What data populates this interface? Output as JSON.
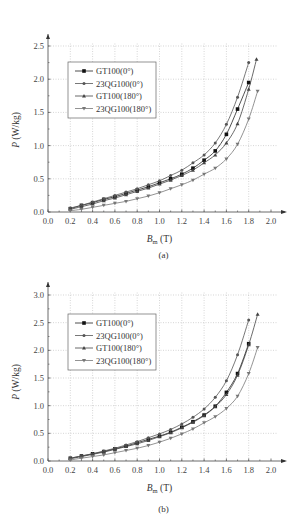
{
  "chart_data": [
    {
      "type": "line",
      "id": "a",
      "caption": "(a)",
      "title": "",
      "xlabel": "B_m (T)",
      "xlabel_main": "B",
      "xlabel_sub": "m",
      "xlabel_unit": " (T)",
      "ylabel": "P (W/kg)",
      "ylabel_var": "P",
      "ylabel_unit": " (W/kg)",
      "xlim": [
        0.0,
        2.0
      ],
      "ylim": [
        0.0,
        2.5
      ],
      "xticks": [
        "0.0",
        "0.2",
        "0.4",
        "0.6",
        "0.8",
        "1.0",
        "1.2",
        "1.4",
        "1.6",
        "1.8",
        "2.0"
      ],
      "yticks": [
        "0.0",
        "0.5",
        "1.0",
        "1.5",
        "2.0",
        "2.5"
      ],
      "grid": true,
      "legend_position": "upper-left",
      "series": [
        {
          "name": "GT100(0°)",
          "marker": "square-filled",
          "x": [
            0.2,
            0.3,
            0.4,
            0.5,
            0.6,
            0.7,
            0.8,
            0.9,
            1.0,
            1.1,
            1.2,
            1.3,
            1.4,
            1.5,
            1.6,
            1.7,
            1.8
          ],
          "y": [
            0.05,
            0.1,
            0.14,
            0.19,
            0.23,
            0.28,
            0.33,
            0.38,
            0.44,
            0.5,
            0.57,
            0.66,
            0.78,
            0.92,
            1.17,
            1.55,
            1.95
          ]
        },
        {
          "name": "23QG100(0°)",
          "marker": "cross",
          "x": [
            0.2,
            0.3,
            0.4,
            0.5,
            0.6,
            0.7,
            0.8,
            0.9,
            1.0,
            1.1,
            1.2,
            1.3,
            1.4,
            1.5,
            1.6,
            1.7,
            1.8
          ],
          "y": [
            0.06,
            0.1,
            0.15,
            0.2,
            0.25,
            0.3,
            0.35,
            0.41,
            0.47,
            0.55,
            0.63,
            0.74,
            0.86,
            1.04,
            1.32,
            1.73,
            2.25
          ]
        },
        {
          "name": "GT100(180°)",
          "marker": "triangle",
          "x": [
            0.2,
            0.3,
            0.4,
            0.5,
            0.6,
            0.7,
            0.8,
            0.9,
            1.0,
            1.1,
            1.2,
            1.3,
            1.4,
            1.5,
            1.6,
            1.7,
            1.8,
            1.87
          ],
          "y": [
            0.04,
            0.08,
            0.12,
            0.17,
            0.21,
            0.26,
            0.31,
            0.36,
            0.42,
            0.48,
            0.55,
            0.63,
            0.74,
            0.86,
            1.04,
            1.33,
            1.85,
            2.3
          ]
        },
        {
          "name": "23QG100(180°)",
          "marker": "down-triangle",
          "x": [
            0.2,
            0.3,
            0.4,
            0.5,
            0.6,
            0.7,
            0.8,
            0.9,
            1.0,
            1.1,
            1.2,
            1.3,
            1.4,
            1.5,
            1.6,
            1.7,
            1.8,
            1.88
          ],
          "y": [
            0.02,
            0.04,
            0.07,
            0.1,
            0.13,
            0.16,
            0.2,
            0.24,
            0.29,
            0.35,
            0.41,
            0.48,
            0.57,
            0.66,
            0.8,
            1.02,
            1.4,
            1.82
          ]
        }
      ]
    },
    {
      "type": "line",
      "id": "b",
      "caption": "(b)",
      "title": "",
      "xlabel": "B_m (T)",
      "xlabel_main": "B",
      "xlabel_sub": "m",
      "xlabel_unit": " (T)",
      "ylabel": "P (W/kg)",
      "ylabel_var": "P",
      "ylabel_unit": " (W/kg)",
      "xlim": [
        0.0,
        2.0
      ],
      "ylim": [
        0.0,
        3.0
      ],
      "xticks": [
        "0.0",
        "0.2",
        "0.4",
        "0.6",
        "0.8",
        "1.0",
        "1.2",
        "1.4",
        "1.6",
        "1.8",
        "2.0"
      ],
      "yticks": [
        "0.0",
        "0.5",
        "1.0",
        "1.5",
        "2.0",
        "2.5",
        "3.0"
      ],
      "grid": true,
      "legend_position": "upper-left",
      "series": [
        {
          "name": "GT100(0°)",
          "marker": "square-filled",
          "x": [
            0.2,
            0.3,
            0.4,
            0.5,
            0.6,
            0.7,
            0.8,
            0.9,
            1.0,
            1.1,
            1.2,
            1.3,
            1.4,
            1.5,
            1.6,
            1.7,
            1.8
          ],
          "y": [
            0.05,
            0.09,
            0.13,
            0.17,
            0.22,
            0.27,
            0.33,
            0.39,
            0.45,
            0.52,
            0.61,
            0.71,
            0.83,
            0.99,
            1.24,
            1.58,
            2.12
          ]
        },
        {
          "name": "23QG100(0°)",
          "marker": "cross",
          "x": [
            0.2,
            0.3,
            0.4,
            0.5,
            0.6,
            0.7,
            0.8,
            0.9,
            1.0,
            1.1,
            1.2,
            1.3,
            1.4,
            1.5,
            1.6,
            1.7,
            1.8
          ],
          "y": [
            0.05,
            0.09,
            0.13,
            0.18,
            0.23,
            0.29,
            0.35,
            0.42,
            0.49,
            0.57,
            0.67,
            0.79,
            0.94,
            1.15,
            1.45,
            1.92,
            2.55
          ]
        },
        {
          "name": "GT100(180°)",
          "marker": "triangle",
          "x": [
            0.2,
            0.3,
            0.4,
            0.5,
            0.6,
            0.7,
            0.8,
            0.9,
            1.0,
            1.1,
            1.2,
            1.3,
            1.4,
            1.5,
            1.6,
            1.7,
            1.8,
            1.88
          ],
          "y": [
            0.04,
            0.08,
            0.12,
            0.16,
            0.21,
            0.26,
            0.31,
            0.37,
            0.44,
            0.51,
            0.6,
            0.7,
            0.82,
            0.98,
            1.2,
            1.55,
            2.1,
            2.65
          ]
        },
        {
          "name": "23QG100(180°)",
          "marker": "down-triangle",
          "x": [
            0.2,
            0.3,
            0.4,
            0.5,
            0.6,
            0.7,
            0.8,
            0.9,
            1.0,
            1.1,
            1.2,
            1.3,
            1.4,
            1.5,
            1.6,
            1.7,
            1.8,
            1.88
          ],
          "y": [
            0.02,
            0.05,
            0.08,
            0.11,
            0.15,
            0.19,
            0.23,
            0.28,
            0.34,
            0.41,
            0.49,
            0.58,
            0.69,
            0.8,
            0.95,
            1.17,
            1.58,
            2.05
          ]
        }
      ]
    }
  ]
}
